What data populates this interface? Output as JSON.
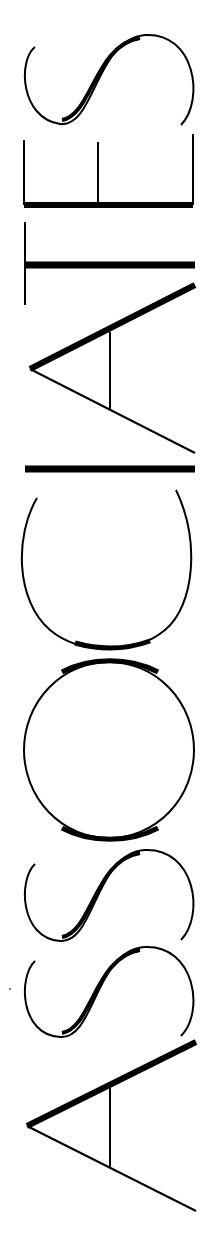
{
  "wordmark": {
    "text": "ASSOCIATES",
    "orientation": "rotated -90deg, reads bottom to top",
    "letters": [
      "A",
      "S",
      "S",
      "O",
      "C",
      "I",
      "A",
      "T",
      "E",
      "S"
    ]
  },
  "colors": {
    "ink": "#000000",
    "background": "#ffffff"
  }
}
